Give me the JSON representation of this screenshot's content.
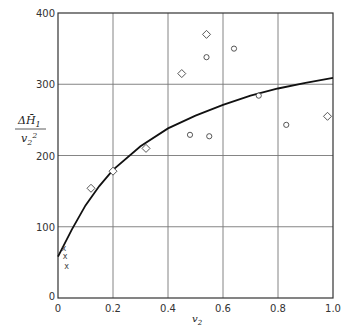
{
  "chart_data": {
    "type": "scatter",
    "title": "",
    "xlabel": "v2",
    "ylabel": "ΔH̄1 / v2²",
    "xlim": [
      0,
      1.0
    ],
    "ylim": [
      0,
      400
    ],
    "xticks": [
      "0",
      "0.2",
      "0.4",
      "0.6",
      "0.8",
      "1.0"
    ],
    "yticks": [
      "0",
      "100",
      "200",
      "300",
      "400"
    ],
    "grid": true,
    "legend": null,
    "series": [
      {
        "name": "diamonds",
        "marker": "diamond",
        "points": [
          [
            0.12,
            154
          ],
          [
            0.2,
            178
          ],
          [
            0.32,
            210
          ],
          [
            0.45,
            315
          ],
          [
            0.54,
            370
          ],
          [
            0.98,
            255
          ]
        ]
      },
      {
        "name": "circles",
        "marker": "circle",
        "points": [
          [
            0.48,
            229
          ],
          [
            0.54,
            338
          ],
          [
            0.55,
            227
          ],
          [
            0.64,
            350
          ],
          [
            0.73,
            284
          ],
          [
            0.83,
            243
          ]
        ]
      },
      {
        "name": "crosses",
        "marker": "x",
        "points": [
          [
            0.01,
            70
          ],
          [
            0.015,
            59
          ],
          [
            0.02,
            45
          ]
        ]
      },
      {
        "name": "fitted curve",
        "marker": "line",
        "points": [
          [
            0,
            58
          ],
          [
            0.05,
            96
          ],
          [
            0.1,
            130
          ],
          [
            0.15,
            157
          ],
          [
            0.2,
            180
          ],
          [
            0.3,
            213
          ],
          [
            0.4,
            238
          ],
          [
            0.5,
            256
          ],
          [
            0.6,
            271
          ],
          [
            0.7,
            284
          ],
          [
            0.8,
            294
          ],
          [
            0.9,
            302
          ],
          [
            1.0,
            309
          ]
        ]
      }
    ]
  },
  "axes": {
    "x_label_main": "v",
    "x_label_sub": "2",
    "y_label_num": "ΔH̄",
    "y_label_num_sub": "1",
    "y_label_den": "v",
    "y_label_den_sub": "2",
    "y_label_den_sup": "2"
  }
}
